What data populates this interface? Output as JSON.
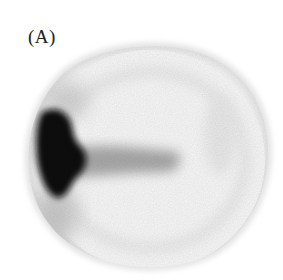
{
  "figure": {
    "panel_label": "(A)",
    "image_type": "grayscale scintigraphy scan",
    "colors": {
      "background": "#ffffff",
      "outline_gray": "#d6d6d6",
      "uptake_dark": "#0d0d0d",
      "band_gray": "#9a9a9a"
    }
  }
}
